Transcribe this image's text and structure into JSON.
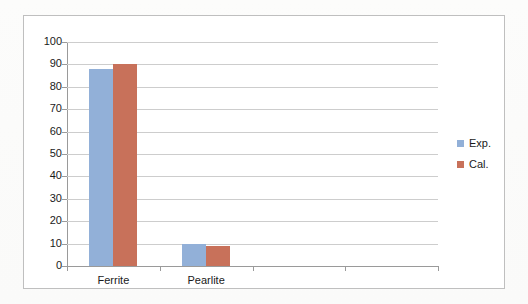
{
  "chart_data": {
    "type": "bar",
    "title": "",
    "xlabel": "",
    "ylabel": "",
    "categories": [
      "Ferrite",
      "Pearlite",
      "",
      ""
    ],
    "series": [
      {
        "name": "Exp.",
        "color": "#92B0D8",
        "values": [
          88,
          10,
          null,
          null
        ]
      },
      {
        "name": "Cal.",
        "color": "#C8715A",
        "values": [
          90,
          9,
          null,
          null
        ]
      }
    ],
    "ylim": [
      0,
      100
    ],
    "ytick_step": 10,
    "yticks": [
      0,
      10,
      20,
      30,
      40,
      50,
      60,
      70,
      80,
      90,
      100
    ],
    "ytick_labels": [
      "0",
      "10",
      "20",
      "30",
      "40",
      "50",
      "60",
      "70",
      "80",
      "90",
      "100"
    ],
    "grid": true,
    "grid_axis": "y",
    "legend_position": "right",
    "legend_entries": [
      {
        "label": "Exp.",
        "color": "#92B0D8"
      },
      {
        "label": "Cal.",
        "color": "#C8715A"
      }
    ],
    "colors": {
      "gridline": "#cdcdcd",
      "axis": "#9a9a9a",
      "frame_border": "#bfbfbf",
      "plot_background": "#ffffff",
      "text": "#1a1a1a"
    }
  }
}
